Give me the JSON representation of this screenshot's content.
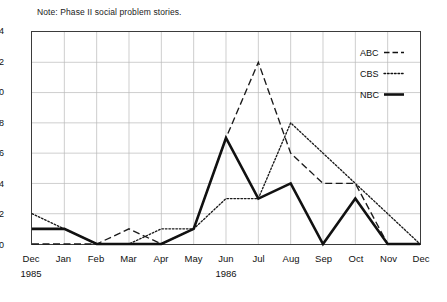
{
  "note": "Note: Phase II social problem stories.",
  "chart_data": {
    "type": "line",
    "title": "",
    "subtitle": "",
    "note": "Note: Phase II social problem stories.",
    "xlabel": "",
    "ylabel": "",
    "ylim": [
      0,
      14
    ],
    "yticks": [
      0,
      2,
      4,
      6,
      8,
      10,
      12,
      14
    ],
    "grid": true,
    "legend_position": "top-right-inside",
    "categories": [
      "Dec",
      "Jan",
      "Feb",
      "Mar",
      "Apr",
      "May",
      "Jun",
      "Jul",
      "Aug",
      "Sep",
      "Oct",
      "Nov",
      "Dec"
    ],
    "year_labels": [
      {
        "label": "1985",
        "category_index": 0
      },
      {
        "label": "1986",
        "category_index": 6
      }
    ],
    "series": [
      {
        "name": "ABC",
        "style": "dashed",
        "color": "#1a1a1a",
        "values": [
          0,
          0,
          0,
          1,
          0,
          1,
          7,
          12,
          6,
          4,
          4,
          0,
          0
        ]
      },
      {
        "name": "CBS",
        "style": "dotted",
        "color": "#1a1a1a",
        "values": [
          2,
          1,
          0,
          0,
          1,
          1,
          3,
          3,
          8,
          6,
          4,
          2,
          0
        ]
      },
      {
        "name": "NBC",
        "style": "solid",
        "color": "#111111",
        "values": [
          1,
          1,
          0,
          0,
          0,
          1,
          7,
          3,
          4,
          0,
          3,
          0,
          0
        ]
      }
    ]
  },
  "legend": {
    "items": [
      {
        "label": "ABC",
        "style": "dashed"
      },
      {
        "label": "CBS",
        "style": "dotted"
      },
      {
        "label": "NBC",
        "style": "solid"
      }
    ]
  },
  "axes": {
    "y_tick_labels": [
      "14",
      "12",
      "10",
      "8",
      "6",
      "4",
      "2",
      "0"
    ],
    "x_tick_labels": [
      "Dec",
      "Jan",
      "Feb",
      "Mar",
      "Apr",
      "May",
      "Jun",
      "Jul",
      "Aug",
      "Sep",
      "Oct",
      "Nov",
      "Dec"
    ],
    "year_1985": "1985",
    "year_1986": "1986"
  }
}
